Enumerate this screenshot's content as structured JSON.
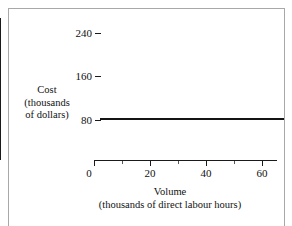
{
  "chart_data": {
    "type": "line",
    "title": "",
    "subtitle": "",
    "xlabel": "Volume",
    "xlabel_sub": "(thousands of direct labour hours)",
    "ylabel": "Cost",
    "ylabel_sub_1": "(thousands",
    "ylabel_sub_2": "of dollars)",
    "xlim": [
      0,
      68
    ],
    "ylim": [
      0,
      260
    ],
    "grid": false,
    "legend": "none",
    "xticks": [
      0,
      20,
      40,
      60
    ],
    "xtick_labels": [
      "0",
      "20",
      "40",
      "60"
    ],
    "xticks_minor": [
      10,
      30,
      50
    ],
    "yticks": [
      80,
      160,
      240
    ],
    "ytick_labels": [
      "80",
      "160",
      "240"
    ],
    "series": [
      {
        "name": "Fixed cost",
        "x": [
          2,
          68
        ],
        "values": [
          82,
          82
        ],
        "color": "#141414"
      }
    ]
  },
  "axes": {
    "y_title_line1": "Cost",
    "y_title_line2": "(thousands",
    "y_title_line3": "of dollars)",
    "x_title_line1": "Volume",
    "x_title_line2": "(thousands of direct labour hours)"
  },
  "ticks": {
    "y": [
      {
        "label": "240",
        "value": 240
      },
      {
        "label": "160",
        "value": 160
      },
      {
        "label": "80",
        "value": 80
      }
    ],
    "x": [
      {
        "label": "0",
        "value": 0
      },
      {
        "label": "20",
        "value": 20
      },
      {
        "label": "40",
        "value": 40
      },
      {
        "label": "60",
        "value": 60
      }
    ]
  },
  "colors": {
    "line": "#141414",
    "axis": "#1a1a1a",
    "frame": "#a8a8a8",
    "background": "#ffffff",
    "text": "#111111"
  }
}
